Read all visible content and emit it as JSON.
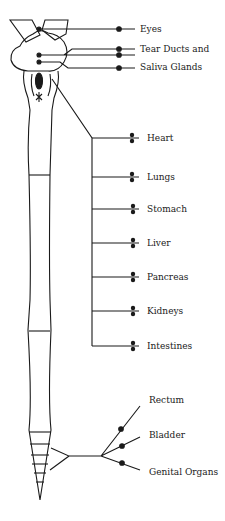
{
  "diagram": {
    "colors": {
      "stroke": "#1a1a1a",
      "background": "#ffffff"
    },
    "head_labels": [
      {
        "text": "Eyes",
        "x": 140,
        "y": 24
      },
      {
        "text": "Tear Ducts and",
        "x": 140,
        "y": 47
      },
      {
        "text": "Saliva Glands",
        "x": 140,
        "y": 61
      }
    ],
    "organ_labels": [
      {
        "text": "Heart",
        "x": 147,
        "y": 134
      },
      {
        "text": "Lungs",
        "x": 147,
        "y": 172
      },
      {
        "text": "Stomach",
        "x": 147,
        "y": 204
      },
      {
        "text": "Liver",
        "x": 147,
        "y": 238
      },
      {
        "text": "Pancreas",
        "x": 147,
        "y": 271
      },
      {
        "text": "Kidneys",
        "x": 147,
        "y": 305
      },
      {
        "text": "Intestines",
        "x": 147,
        "y": 340
      }
    ],
    "pelvic_labels": [
      {
        "text": "Rectum",
        "x": 149,
        "y": 394
      },
      {
        "text": "Bladder",
        "x": 149,
        "y": 430
      },
      {
        "text": "Genital Organs",
        "x": 149,
        "y": 468
      }
    ]
  }
}
